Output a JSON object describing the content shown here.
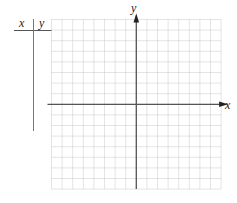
{
  "table": {
    "header_x": "x",
    "header_y": "y",
    "rows": []
  },
  "graph": {
    "x_axis_label": "x",
    "y_axis_label": "y",
    "grid": {
      "columns": 16,
      "rows": 16,
      "left": 51.5,
      "top": 19.5,
      "cell": 10.6,
      "origin_col": 8,
      "origin_row": 8
    },
    "colors": {
      "grid_line": "#c8c8c8",
      "axis": "#555555",
      "table_rule": "#666666"
    }
  }
}
